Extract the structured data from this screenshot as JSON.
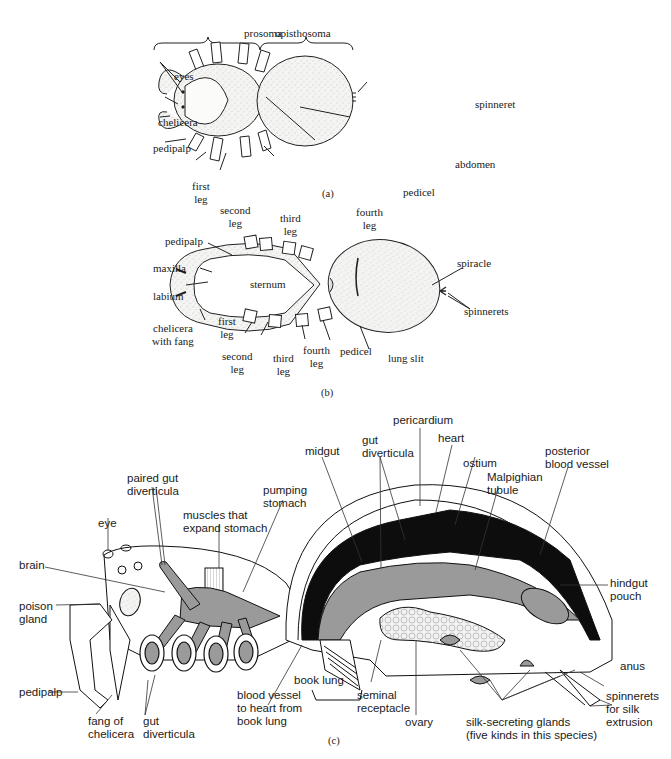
{
  "figure": {
    "panels": [
      {
        "id": "a",
        "caption": "(a)",
        "view": "dorsal",
        "labels": {
          "prosoma": "prosoma",
          "opisthosoma": "opisthosoma",
          "eyes": "eyes",
          "chelicera": "chelicera",
          "pedipalp": "pedipalp",
          "first_leg": "first\nleg",
          "second_leg": "second\nleg",
          "third_leg": "third\nleg",
          "fourth_leg": "fourth\nleg",
          "pedicel": "pedicel",
          "abdomen": "abdomen",
          "spinneret": "spinneret"
        }
      },
      {
        "id": "b",
        "caption": "(b)",
        "view": "ventral",
        "labels": {
          "pedipalp": "pedipalp",
          "maxilla": "maxilla",
          "labium": "labium",
          "chelicera_with_fang": "chelicera\nwith fang",
          "sternum": "sternum",
          "first_leg": "first\nleg",
          "second_leg": "second\nleg",
          "third_leg": "third\nleg",
          "fourth_leg": "fourth\nleg",
          "pedicel": "pedicel",
          "lung_slit": "lung slit",
          "spiracle": "spiracle",
          "spinnerets": "spinnerets"
        }
      },
      {
        "id": "c",
        "caption": "(c)",
        "view": "internal anatomy (lateral section)",
        "labels": {
          "paired_gut_diverticula": "paired gut\ndiverticula",
          "muscles_expand_stomach": "muscles that\nexpand stomach",
          "pumping_stomach": "pumping\nstomach",
          "midgut": "midgut",
          "gut_diverticula_top": "gut\ndiverticula",
          "pericardium": "pericardium",
          "heart": "heart",
          "ostium": "ostium",
          "malpighian_tubule": "Malpighian\ntubule",
          "posterior_blood_vessel": "posterior\nblood vessel",
          "eye": "eye",
          "brain": "brain",
          "poison_gland": "poison\ngland",
          "pedipalp": "pedipalp",
          "hindgut_pouch": "hindgut\npouch",
          "anus": "anus",
          "spinnerets_for_silk": "spinnerets\nfor silk\nextrusion",
          "fang_of_chelicera": "fang of\nchelicera",
          "gut_diverticula_bottom": "gut\ndiverticula",
          "blood_vessel_book_lung": "blood vessel\nto heart from\nbook lung",
          "book_lung": "book lung",
          "seminal_receptacle": "seminal\nreceptacle",
          "ovary": "ovary",
          "silk_glands": "silk-secreting glands\n(five kinds in this species)"
        }
      }
    ],
    "colors": {
      "ink": "#111111",
      "body_fill": "#f3f3f1",
      "gut_gray": "#9a9a9a",
      "heart_black": "#0d0d0d",
      "background": "#ffffff"
    }
  }
}
